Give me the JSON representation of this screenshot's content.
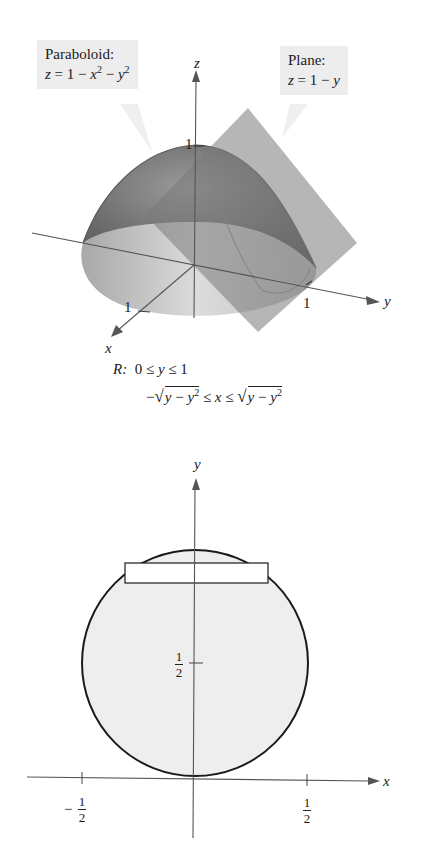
{
  "figure_3d": {
    "callout_paraboloid": {
      "title": "Paraboloid:",
      "equation": {
        "lhs": "z",
        "eq": " = 1 − ",
        "x": "x",
        "x_exp": "2",
        "minus": " − ",
        "y": "y",
        "y_exp": "2"
      }
    },
    "callout_plane": {
      "title": "Plane:",
      "equation": {
        "lhs": "z",
        "eq": " = 1 − ",
        "y": "y"
      }
    },
    "axes": {
      "x_label": "x",
      "y_label": "y",
      "z_label": "z"
    },
    "ticks": {
      "z_tick": "1",
      "x_tick": "1",
      "y_tick": "1"
    }
  },
  "region": {
    "label": "R:",
    "line1": {
      "left": "0 ≤ ",
      "var": "y",
      "right": " ≤ 1"
    },
    "line2": {
      "neg": "−",
      "radicand_left": {
        "a": "y",
        "op": " − ",
        "b": "y",
        "exp": "2"
      },
      "middle_left": " ≤ ",
      "var": "x",
      "middle_right": " ≤ ",
      "radicand_right": {
        "a": "y",
        "op": " − ",
        "b": "y",
        "exp": "2"
      }
    }
  },
  "figure_2d": {
    "axes": {
      "x_label": "x",
      "y_label": "y"
    },
    "ticks": {
      "y_half": {
        "num": "1",
        "den": "2"
      },
      "x_neg_half": {
        "sign": "−",
        "num": "1",
        "den": "2"
      },
      "x_half": {
        "num": "1",
        "den": "2"
      }
    },
    "circle": {
      "center": [
        0,
        0.5
      ],
      "radius": 0.5
    },
    "colors": {
      "region_fill": "#eeeeee",
      "outline": "#1a1a1a",
      "strip_fill": "#ffffff"
    }
  }
}
